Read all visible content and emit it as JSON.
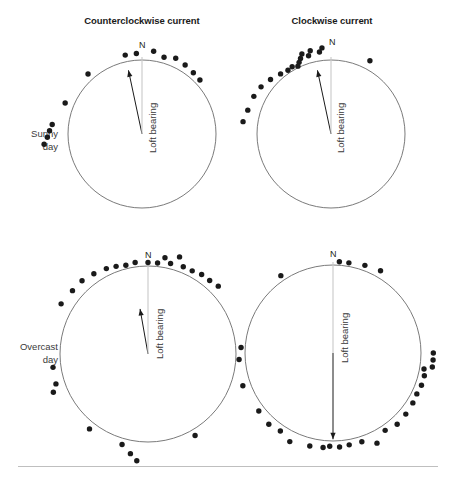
{
  "figure": {
    "width": 455,
    "height": 479,
    "background": "#ffffff",
    "point_color": "#1a1a1a",
    "circle_color": "#6b6b6b",
    "arrow_color": "#1a1a1a",
    "rule_color": "#bfbfbf"
  },
  "columns": [
    {
      "key": "ccw",
      "title": "Counterclockwise current"
    },
    {
      "key": "cw",
      "title": "Clockwise current"
    }
  ],
  "rows": [
    {
      "key": "sunny",
      "label": "Sunny\nday",
      "line1": "Sunny",
      "line2": "day"
    },
    {
      "key": "overcast",
      "label": "Overcast\nday",
      "line1": "Overcast",
      "line2": "day"
    }
  ],
  "labels": {
    "north": "N",
    "loft_bearing": "Loft bearing"
  },
  "chart_data": {
    "type": "scatter",
    "subtype": "circular-orientation-diagram",
    "title": "",
    "grid": false,
    "legend": false,
    "axis_note": "Bearings in degrees clockwise from North (0 deg = up)",
    "panels": [
      {
        "id": "sunny-counterclockwise",
        "row": "Sunny day",
        "column": "Counterclockwise current",
        "center": {
          "x": 82,
          "y": 96
        },
        "radius": 74,
        "loft_bearing_deg": 348,
        "loft_arrow_length_ratio": 0.88,
        "n_points": 14,
        "bearings_deg": [
          348,
          356,
          8,
          16,
          24,
          32,
          40,
          47,
          318,
          292,
          276,
          272,
          268,
          264
        ],
        "point_radius_ratio": [
          1.09,
          1.09,
          1.13,
          1.08,
          1.12,
          1.1,
          1.08,
          1.07,
          1.09,
          1.12,
          1.22,
          1.25,
          1.28,
          1.33
        ]
      },
      {
        "id": "sunny-clockwise",
        "row": "Sunny day",
        "column": "Clockwise current",
        "center": {
          "x": 83,
          "y": 96
        },
        "radius": 74,
        "loft_bearing_deg": 348,
        "loft_arrow_length_ratio": 0.88,
        "n_points": 17,
        "bearings_deg": [
          354,
          352,
          346,
          344,
          340,
          338,
          336,
          334,
          330,
          326,
          320,
          312,
          304,
          296,
          286,
          278,
          28
        ],
        "point_radius_ratio": [
          1.17,
          1.12,
          1.16,
          1.1,
          1.15,
          1.1,
          1.06,
          1.02,
          1.05,
          1.04,
          1.06,
          1.1,
          1.14,
          1.16,
          1.17,
          1.2,
          1.12
        ]
      },
      {
        "id": "overcast-counterclockwise",
        "row": "Overcast day",
        "column": "Counterclockwise current",
        "center": {
          "x": 98,
          "y": 104
        },
        "radius": 88,
        "loft_bearing_deg": 350,
        "loft_arrow_length_ratio": 0.52,
        "n_points": 27,
        "bearings_deg": [
          0,
          6,
          10,
          14,
          18,
          22,
          28,
          34,
          40,
          46,
          352,
          346,
          340,
          334,
          326,
          318,
          310,
          300,
          262,
          252,
          248,
          218,
          196,
          190,
          186,
          150,
          86
        ],
        "point_radius_ratio": [
          1.04,
          1.04,
          1.11,
          1.06,
          1.16,
          1.07,
          1.07,
          1.09,
          1.09,
          1.11,
          1.05,
          1.04,
          1.06,
          1.08,
          1.1,
          1.12,
          1.12,
          1.14,
          1.09,
          1.1,
          1.16,
          1.08,
          1.07,
          1.15,
          1.22,
          1.07,
          1.06
        ]
      },
      {
        "id": "overcast-clockwise",
        "row": "Overcast day",
        "column": "Clockwise current",
        "center": {
          "x": 98,
          "y": 103
        },
        "radius": 88,
        "loft_bearing_deg": 180,
        "loft_arrow_length_ratio": 0.98,
        "n_points": 29,
        "bearings_deg": [
          4,
          10,
          20,
          30,
          326,
          90,
          94,
          98,
          100,
          104,
          110,
          116,
          122,
          130,
          138,
          146,
          154,
          162,
          170,
          176,
          182,
          186,
          194,
          206,
          214,
          222,
          232,
          250,
          266
        ],
        "point_radius_ratio": [
          1.04,
          1.04,
          1.06,
          1.08,
          1.06,
          1.14,
          1.14,
          1.14,
          1.05,
          1.07,
          1.07,
          1.06,
          1.07,
          1.08,
          1.09,
          1.06,
          1.14,
          1.06,
          1.06,
          1.07,
          1.06,
          1.08,
          1.09,
          1.12,
          1.07,
          1.09,
          1.07,
          1.09,
          1.07
        ]
      }
    ]
  }
}
